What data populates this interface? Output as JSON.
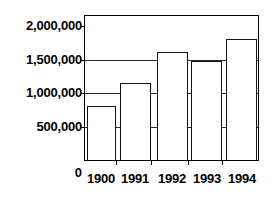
{
  "chart_data": {
    "type": "bar",
    "title": "",
    "xlabel": "",
    "ylabel": "",
    "categories": [
      "1900",
      "1991",
      "1992",
      "1993",
      "1994"
    ],
    "values": [
      800000,
      1150000,
      1620000,
      1480000,
      1800000
    ],
    "series": [
      {
        "name": "",
        "values": [
          800000,
          1150000,
          1620000,
          1480000,
          1800000
        ]
      }
    ],
    "ylim": [
      0,
      2150000
    ],
    "yticks": [
      0,
      500000,
      1000000,
      1500000,
      2000000
    ],
    "ytick_labels": [
      "0",
      "500,000",
      "1,000,000",
      "1,500,000",
      "2,000,000"
    ],
    "gridlines": [
      "500,000",
      "1,000,000",
      "1,500,000"
    ],
    "grid": true,
    "legend": false,
    "legend_position": "none",
    "bar_fill_color": "#ffffff",
    "bar_edge_color": "#111111",
    "axis_color": "#000000",
    "grid_color": "#2b2b2b",
    "background_color": "#ffffff"
  },
  "axes": {
    "y_labels": [
      {
        "text": "2,000,000",
        "value": 2000000
      },
      {
        "text": "1,500,000",
        "value": 1500000
      },
      {
        "text": "1,000,000",
        "value": 1000000
      },
      {
        "text": "500,000",
        "value": 500000
      },
      {
        "text": "0",
        "value": 0
      }
    ],
    "x_labels": [
      {
        "text": "1900"
      },
      {
        "text": "1991"
      },
      {
        "text": "1992"
      },
      {
        "text": "1993"
      },
      {
        "text": "1994"
      }
    ]
  }
}
